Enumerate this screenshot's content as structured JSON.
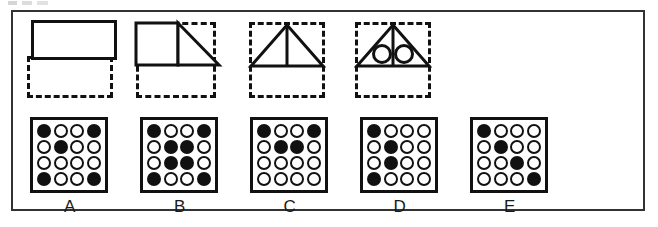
{
  "figure_panels": [
    {
      "id": "panel-1",
      "left": 14,
      "type": "rectangle-over-dashed-box",
      "description": "solid rectangle above dashed rectangle"
    },
    {
      "id": "panel-2",
      "left": 118,
      "type": "square-and-right-triangle-in-dashed-box",
      "description": "square with right triangle in dashed square"
    },
    {
      "id": "panel-3",
      "left": 234,
      "type": "triangle-with-median-in-dashed-box",
      "description": "isosceles triangle with vertical median in dashed square"
    },
    {
      "id": "panel-4",
      "left": 340,
      "type": "triangle-with-median-and-two-circles-in-dashed-box",
      "description": "isosceles triangle with vertical median and two circles in dashed square"
    }
  ],
  "grid_panels": [
    {
      "label": "A",
      "left": 17,
      "rows": [
        [
          1,
          0,
          0,
          1
        ],
        [
          0,
          1,
          0,
          0
        ],
        [
          0,
          0,
          0,
          0
        ],
        [
          1,
          0,
          0,
          1
        ]
      ]
    },
    {
      "label": "B",
      "left": 127,
      "rows": [
        [
          1,
          0,
          0,
          1
        ],
        [
          0,
          1,
          1,
          0
        ],
        [
          0,
          1,
          1,
          0
        ],
        [
          1,
          0,
          0,
          1
        ]
      ]
    },
    {
      "label": "C",
      "left": 237,
      "rows": [
        [
          1,
          0,
          0,
          1
        ],
        [
          0,
          1,
          1,
          0
        ],
        [
          0,
          0,
          0,
          0
        ],
        [
          0,
          0,
          0,
          0
        ]
      ]
    },
    {
      "label": "D",
      "left": 347,
      "rows": [
        [
          1,
          0,
          0,
          0
        ],
        [
          0,
          1,
          0,
          0
        ],
        [
          0,
          1,
          0,
          0
        ],
        [
          1,
          0,
          0,
          0
        ]
      ]
    },
    {
      "label": "E",
      "left": 457,
      "rows": [
        [
          1,
          0,
          0,
          0
        ],
        [
          0,
          1,
          0,
          0
        ],
        [
          0,
          0,
          1,
          0
        ],
        [
          0,
          0,
          0,
          1
        ]
      ]
    }
  ],
  "colors": {
    "ink": "#111111",
    "frame": "#323232",
    "paper": "#ffffff"
  }
}
